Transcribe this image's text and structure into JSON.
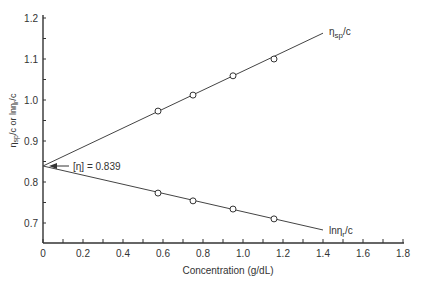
{
  "chart_data": {
    "type": "line",
    "title": "",
    "xlabel": "Concentration (g/dL)",
    "ylabel": "ηsp/c or lnηr/c",
    "xlim": [
      0,
      1.8
    ],
    "ylim": [
      0.7,
      1.2
    ],
    "x_ticks": [
      "0",
      "0.2",
      "0.4",
      "0.6",
      "0.8",
      "1.0",
      "1.2",
      "1.4",
      "1.6",
      "1.8"
    ],
    "y_ticks": [
      "0.7",
      "0.8",
      "0.9",
      "1.0",
      "1.1",
      "1.2"
    ],
    "grid": false,
    "legend": "inline labels at line ends",
    "series": [
      {
        "name": "ηsp/c",
        "label_main": "η",
        "label_sub": "sp",
        "label_tail": "/c",
        "x": [
          0.575,
          0.75,
          0.95,
          1.155
        ],
        "values": [
          0.973,
          1.012,
          1.059,
          1.1
        ],
        "fit_line": {
          "x0": 0,
          "y0": 0.839,
          "x1": 1.4,
          "y1": 1.163
        }
      },
      {
        "name": "lnηr/c",
        "label_main": "lnη",
        "label_sub": "r",
        "label_tail": "/c",
        "x": [
          0.575,
          0.75,
          0.95,
          1.155
        ],
        "values": [
          0.773,
          0.754,
          0.734,
          0.71
        ],
        "fit_line": {
          "x0": 0,
          "y0": 0.839,
          "x1": 1.4,
          "y1": 0.683
        }
      }
    ],
    "annotations": [
      {
        "text": "[η] = 0.839",
        "x": 0,
        "y": 0.839,
        "type": "arrow"
      }
    ]
  }
}
